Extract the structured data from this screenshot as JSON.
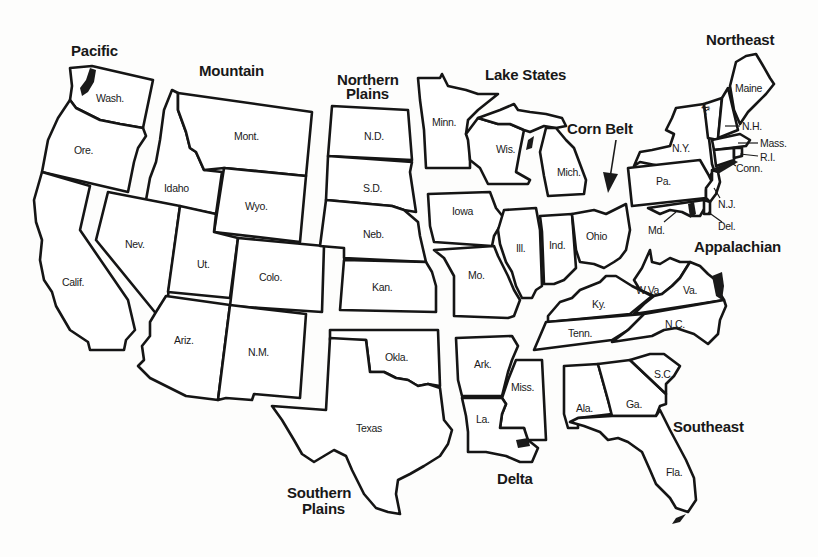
{
  "map": {
    "title": "U.S. farm production regions",
    "regions": [
      {
        "id": "pacific",
        "label": "Pacific",
        "lines": [
          "Pacific"
        ]
      },
      {
        "id": "mountain",
        "label": "Mountain",
        "lines": [
          "Mountain"
        ]
      },
      {
        "id": "northern-plains",
        "label": "Northern Plains",
        "lines": [
          "Northern",
          "Plains"
        ]
      },
      {
        "id": "lake-states",
        "label": "Lake States",
        "lines": [
          "Lake States"
        ]
      },
      {
        "id": "corn-belt",
        "label": "Corn Belt",
        "lines": [
          "Corn Belt"
        ]
      },
      {
        "id": "northeast",
        "label": "Northeast",
        "lines": [
          "Northeast"
        ]
      },
      {
        "id": "appalachian",
        "label": "Appalachian",
        "lines": [
          "Appalachian"
        ]
      },
      {
        "id": "southeast",
        "label": "Southeast",
        "lines": [
          "Southeast"
        ]
      },
      {
        "id": "delta",
        "label": "Delta",
        "lines": [
          "Delta"
        ]
      },
      {
        "id": "southern-plains",
        "label": "Southern Plains",
        "lines": [
          "Southern",
          "Plains"
        ]
      }
    ],
    "states": {
      "wash": "Wash.",
      "ore": "Ore.",
      "calif": "Calif.",
      "mont": "Mont.",
      "idaho": "Idaho",
      "wyo": "Wyo.",
      "nev": "Nev.",
      "ut": "Ut.",
      "colo": "Colo.",
      "ariz": "Ariz.",
      "nm": "N.M.",
      "nd": "N.D.",
      "sd": "S.D.",
      "neb": "Neb.",
      "kan": "Kan.",
      "minn": "Minn.",
      "wis": "Wis.",
      "mich": "Mich.",
      "iowa": "Iowa",
      "mo": "Mo.",
      "ill": "Ill.",
      "ind": "Ind.",
      "ohio": "Ohio",
      "maine": "Maine",
      "vt": "Vt.",
      "nh": "N.H.",
      "mass": "Mass.",
      "ri": "R.I.",
      "conn": "Conn.",
      "ny": "N.Y.",
      "pa": "Pa.",
      "nj": "N.J.",
      "del": "Del.",
      "md": "Md.",
      "wva": "W.Va.",
      "va": "Va.",
      "ky": "Ky.",
      "tenn": "Tenn.",
      "nc": "N.C.",
      "sc": "S.C.",
      "ga": "Ga.",
      "ala": "Ala.",
      "fla": "Fla.",
      "ark": "Ark.",
      "miss": "Miss.",
      "la": "La.",
      "okla": "Okla.",
      "texas": "Texas"
    }
  }
}
